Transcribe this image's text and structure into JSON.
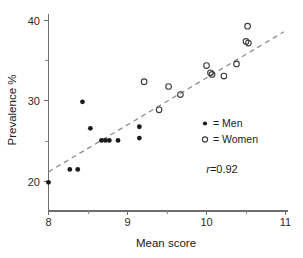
{
  "chart_data": {
    "type": "scatter",
    "title": "",
    "xlabel": "Mean score",
    "ylabel": "Prevalence %",
    "xlim": [
      8,
      11
    ],
    "ylim": [
      16,
      41.5
    ],
    "xticks": [
      8,
      9,
      10,
      11
    ],
    "xtick_labels": [
      "8",
      "9",
      "10",
      "11"
    ],
    "x_minor_ticks": [
      8.5,
      9.5,
      10.5
    ],
    "yticks": [
      20,
      30,
      40
    ],
    "ytick_labels": [
      "20",
      "30",
      "40"
    ],
    "y_minor_ticks": [
      25,
      35
    ],
    "grid": false,
    "legend_position": "center-right",
    "annotations": [
      {
        "name": "correlation",
        "symbol": "r",
        "text": "=0.92",
        "full": "r=0.92",
        "x": 10.05,
        "y": 21.8
      }
    ],
    "series": [
      {
        "name": "Men",
        "marker": "filled-circle",
        "color": "#1a1a1a",
        "legend_label": "= Men",
        "points": [
          {
            "x": 8.0,
            "y": 19.9
          },
          {
            "x": 8.27,
            "y": 21.5
          },
          {
            "x": 8.37,
            "y": 21.5
          },
          {
            "x": 8.43,
            "y": 29.9
          },
          {
            "x": 8.53,
            "y": 26.6
          },
          {
            "x": 8.67,
            "y": 25.1
          },
          {
            "x": 8.72,
            "y": 25.1
          },
          {
            "x": 8.77,
            "y": 25.1
          },
          {
            "x": 8.88,
            "y": 25.1
          },
          {
            "x": 9.15,
            "y": 26.8
          },
          {
            "x": 9.15,
            "y": 25.4
          }
        ]
      },
      {
        "name": "Women",
        "marker": "open-circle",
        "color": "#3a3a3a",
        "legend_label": "= Women",
        "points": [
          {
            "x": 9.21,
            "y": 32.4
          },
          {
            "x": 9.4,
            "y": 28.9
          },
          {
            "x": 9.52,
            "y": 31.8
          },
          {
            "x": 9.67,
            "y": 30.8
          },
          {
            "x": 10.0,
            "y": 34.4
          },
          {
            "x": 10.05,
            "y": 33.5
          },
          {
            "x": 10.07,
            "y": 33.3
          },
          {
            "x": 10.22,
            "y": 33.1
          },
          {
            "x": 10.38,
            "y": 34.6
          },
          {
            "x": 10.5,
            "y": 37.4
          },
          {
            "x": 10.53,
            "y": 37.2
          },
          {
            "x": 10.52,
            "y": 39.3
          }
        ]
      }
    ],
    "fit_line": {
      "name": "regression-line",
      "style": "dashed",
      "color": "#8d8d8d",
      "x_start": 8.0,
      "y_start": 21.2,
      "x_end": 10.98,
      "y_end": 38.6
    },
    "correlation": 0.92
  },
  "legend": {
    "entries": [
      {
        "marker": "filled-circle",
        "label": "= Men"
      },
      {
        "marker": "open-circle",
        "label": "= Women"
      }
    ]
  }
}
